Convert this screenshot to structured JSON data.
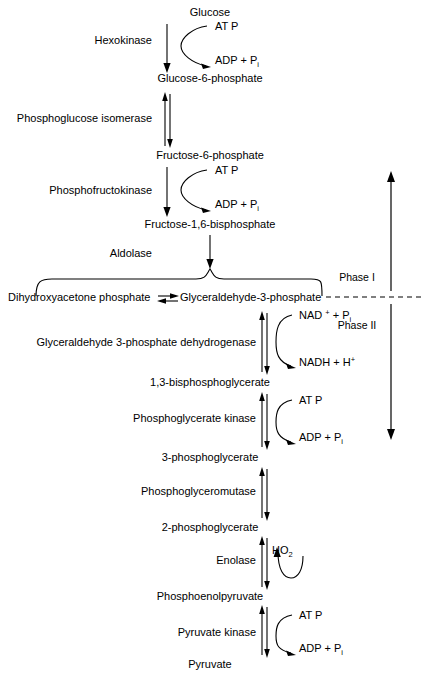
{
  "figure": {
    "background": "#ffffff",
    "ink": "#000000"
  },
  "metabolites": [
    {
      "id": "glucose",
      "label": "Glucose",
      "x": 210,
      "y": 16
    },
    {
      "id": "g6p",
      "label": "Glucose-6-phosphate",
      "x": 210,
      "y": 82
    },
    {
      "id": "f6p",
      "label": "Fructose-6-phosphate",
      "x": 210,
      "y": 159
    },
    {
      "id": "fbp",
      "label": "Fructose-1,6-bisphosphate",
      "x": 210,
      "y": 228
    },
    {
      "id": "dhap",
      "label": "Dihydroxyacetone phosphate",
      "x": 8,
      "y": 301,
      "anchor": "start"
    },
    {
      "id": "g3p",
      "label": "Glyceraldehyde-3-phosphate",
      "x": 180,
      "y": 301,
      "anchor": "start"
    },
    {
      "id": "bpg",
      "label": "1,3-bisphosphoglycerate",
      "x": 210,
      "y": 386
    },
    {
      "id": "pg3",
      "label": "3-phosphoglycerate",
      "x": 210,
      "y": 461
    },
    {
      "id": "pg2",
      "label": "2-phosphoglycerate",
      "x": 210,
      "y": 531
    },
    {
      "id": "pep",
      "label": "Phosphoenolpyruvate",
      "x": 210,
      "y": 600
    },
    {
      "id": "pyruvate",
      "label": "Pyruvate",
      "x": 210,
      "y": 668
    }
  ],
  "enzymes": [
    {
      "id": "hexokinase",
      "label": "Hexokinase",
      "x": 152,
      "y": 44,
      "anchor": "end"
    },
    {
      "id": "pgi",
      "label": "Phosphoglucose isomerase",
      "x": 152,
      "y": 122,
      "anchor": "end"
    },
    {
      "id": "pfk",
      "label": "Phosphofructokinase",
      "x": 152,
      "y": 194,
      "anchor": "end"
    },
    {
      "id": "aldolase",
      "label": "Aldolase",
      "x": 152,
      "y": 257,
      "anchor": "end"
    },
    {
      "id": "gapdh",
      "label": "Glyceraldehyde 3-phosphate dehydrogenase",
      "x": 256,
      "y": 346,
      "anchor": "end"
    },
    {
      "id": "pgk",
      "label": "Phosphoglycerate kinase",
      "x": 256,
      "y": 422,
      "anchor": "end"
    },
    {
      "id": "pgm",
      "label": "Phosphoglyceromutase",
      "x": 256,
      "y": 495,
      "anchor": "end"
    },
    {
      "id": "enolase",
      "label": "Enolase",
      "x": 256,
      "y": 564,
      "anchor": "end"
    },
    {
      "id": "pyruvate-kinase",
      "label": "Pyruvate kinase",
      "x": 256,
      "y": 636,
      "anchor": "end"
    }
  ],
  "cofactors": [
    {
      "id": "atp-1",
      "base": "AT P",
      "sup": "",
      "sub": "",
      "tail": "",
      "x": 215,
      "y": 30,
      "role": "substrate"
    },
    {
      "id": "adp-1",
      "base": "ADP  + P",
      "sup": "",
      "sub": "i",
      "tail": "",
      "x": 215,
      "y": 64,
      "role": "product"
    },
    {
      "id": "atp-2",
      "base": "AT P",
      "sup": "",
      "sub": "",
      "tail": "",
      "x": 215,
      "y": 174,
      "role": "substrate"
    },
    {
      "id": "adp-2",
      "base": "ADP  + P",
      "sup": "",
      "sub": "i",
      "tail": "",
      "x": 215,
      "y": 208,
      "role": "product"
    },
    {
      "id": "nad",
      "base": "NAD ",
      "sup": "+",
      "sub": "i",
      "tail": " + P",
      "x": 299,
      "y": 319,
      "role": "substrate"
    },
    {
      "id": "nadh",
      "base": "NADH + H",
      "sup": "+",
      "sub": "",
      "tail": "",
      "x": 299,
      "y": 366,
      "role": "product"
    },
    {
      "id": "atp-3",
      "base": "AT P",
      "sup": "",
      "sub": "",
      "tail": "",
      "x": 299,
      "y": 404,
      "role": "substrate"
    },
    {
      "id": "adp-3",
      "base": "ADP  + P",
      "sup": "",
      "sub": "i",
      "tail": "",
      "x": 299,
      "y": 441,
      "role": "product"
    },
    {
      "id": "h2o",
      "base": "H",
      "sup": "",
      "sub": "2",
      "tail": "O",
      "x": 272,
      "y": 554,
      "role": "product-u"
    },
    {
      "id": "atp-4",
      "base": "AT P",
      "sup": "",
      "sub": "",
      "tail": "",
      "x": 299,
      "y": 619,
      "role": "substrate"
    },
    {
      "id": "adp-4",
      "base": "ADP  + P",
      "sup": "",
      "sub": "i",
      "tail": "",
      "x": 299,
      "y": 652,
      "role": "product"
    }
  ],
  "phases": [
    {
      "id": "phase-1",
      "label": "Phase I",
      "x": 357,
      "y": 281,
      "direction": "up"
    },
    {
      "id": "phase-2",
      "label": "Phase II",
      "x": 357,
      "y": 329,
      "direction": "down"
    }
  ],
  "divider": {
    "id": "phase-divider",
    "label": "dashed phase separator",
    "y": 297,
    "x1": 326,
    "x2": 423
  }
}
